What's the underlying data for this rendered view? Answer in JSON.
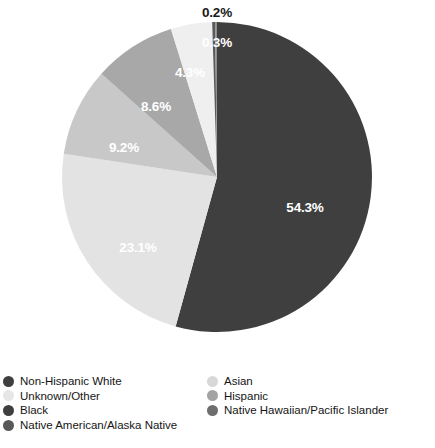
{
  "chart_data": {
    "type": "pie",
    "title": "",
    "categories": [
      "Non-Hispanic White",
      "Black",
      "Hispanic",
      "Asian",
      "Unknown/Other",
      "Native American/Alaska Native",
      "Native Hawaiian/Pacific Islander"
    ],
    "values": [
      54.3,
      23.1,
      9.2,
      8.6,
      4.3,
      0.3,
      0.2
    ],
    "value_labels": [
      "54.3%",
      "23.1%",
      "9.2%",
      "8.6%",
      "4.3%",
      "0.3%",
      "0.2%"
    ],
    "unit": "percent",
    "legend_position": "bottom",
    "grid": false,
    "colors": [
      "#3f3f3f",
      "#e3e3e3",
      "#c8c8c8",
      "#a8a8a8",
      "#efefef",
      "#5a5a5a",
      "#8f8f8f"
    ],
    "slice_order_clockwise_from_top": [
      "Non-Hispanic White",
      "Black",
      "Hispanic",
      "Asian",
      "Unknown/Other",
      "Native American/Alaska Native",
      "Native Hawaiian/Pacific Islander"
    ]
  },
  "pie": {
    "center_x": 217,
    "center_y": 177,
    "radius": 155,
    "labels": [
      {
        "id": "label-non-hispanic-white",
        "text": "54.3%",
        "x": 305,
        "y": 207,
        "outside": false
      },
      {
        "id": "label-black",
        "text": "23.1%",
        "x": 138,
        "y": 247,
        "outside": false
      },
      {
        "id": "label-hispanic",
        "text": "9.2%",
        "x": 124,
        "y": 147,
        "outside": false
      },
      {
        "id": "label-asian",
        "text": "8.6%",
        "x": 156,
        "y": 106,
        "outside": false
      },
      {
        "id": "label-unknown-other",
        "text": "4.3%",
        "x": 190,
        "y": 72,
        "outside": false
      },
      {
        "id": "label-native-american",
        "text": "0.3%",
        "x": 217,
        "y": 42,
        "outside": false
      },
      {
        "id": "label-native-hawaiian",
        "text": "0.2%",
        "x": 217,
        "y": 12,
        "outside": true
      }
    ]
  },
  "legend": {
    "left_column": [
      {
        "label": "Non-Hispanic White",
        "color": "#3f3f3f",
        "name": "legend-item-non-hispanic-white"
      },
      {
        "label": "Unknown/Other",
        "color": "#e6e6e6",
        "name": "legend-item-unknown-other"
      },
      {
        "label": "Black",
        "color": "#3f3f3f",
        "name": "legend-item-black"
      },
      {
        "label": "Native American/Alaska Native",
        "color": "#585858",
        "name": "legend-item-native-american"
      }
    ],
    "right_column": [
      {
        "label": "Asian",
        "color": "#d8d8d8",
        "name": "legend-item-asian"
      },
      {
        "label": "Hispanic",
        "color": "#a3a3a3",
        "name": "legend-item-hispanic"
      },
      {
        "label": "Native Hawaiian/Pacific Islander",
        "color": "#6e6e6e",
        "name": "legend-item-native-hawaiian"
      }
    ]
  }
}
